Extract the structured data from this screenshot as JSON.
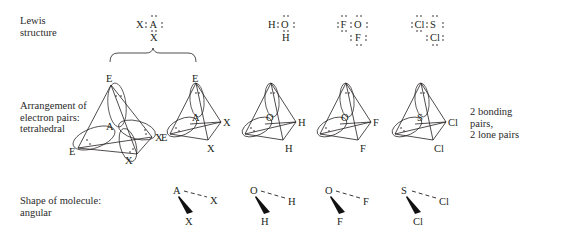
{
  "row_labels": {
    "lewis": [
      "Lewis",
      "structure"
    ],
    "arrangement": [
      "Arrangement of",
      "electron pairs:",
      "tetrahedral"
    ],
    "shape": [
      "Shape of molecule:",
      "angular"
    ]
  },
  "side_note": [
    "2 bonding",
    "pairs,",
    "2 lone pairs"
  ],
  "lewis_structures": [
    {
      "id": "generic",
      "left": "X",
      "center": "A",
      "below": "X"
    },
    {
      "id": "water",
      "left": "H",
      "center": "O",
      "below": "H"
    },
    {
      "id": "oxygen-difluoride",
      "left": "F",
      "center": "O",
      "below": "F"
    },
    {
      "id": "sulfur-dichloride",
      "left": "Cl",
      "center": "S",
      "below": "Cl"
    }
  ],
  "tetrahedra": [
    {
      "id": "generic-large",
      "center": "A",
      "apex": "E",
      "left": "E",
      "right": "X",
      "front": "X"
    },
    {
      "id": "generic",
      "center": "A",
      "apex": "E",
      "left": "E",
      "right": "X",
      "front": "X"
    },
    {
      "id": "water",
      "center": "O",
      "apex": "",
      "left": "",
      "right": "H",
      "front": "H"
    },
    {
      "id": "oxygen-difluoride",
      "center": "O",
      "apex": "",
      "left": "",
      "right": "F",
      "front": "F"
    },
    {
      "id": "sulfur-dichloride",
      "center": "S",
      "apex": "",
      "left": "",
      "right": "Cl",
      "front": "Cl"
    }
  ],
  "shapes": [
    {
      "id": "generic",
      "center": "A",
      "dashed": "X",
      "wedge": "X"
    },
    {
      "id": "water",
      "center": "O",
      "dashed": "H",
      "wedge": "H"
    },
    {
      "id": "oxygen-difluoride",
      "center": "O",
      "dashed": "F",
      "wedge": "F"
    },
    {
      "id": "sulfur-dichloride",
      "center": "S",
      "dashed": "Cl",
      "wedge": "Cl"
    }
  ]
}
